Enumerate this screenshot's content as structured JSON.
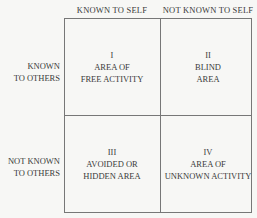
{
  "columns": [
    "KNOWN TO SELF",
    "NOT KNOWN TO SELF"
  ],
  "rows": [
    {
      "line1": "KNOWN",
      "line2": "TO OTHERS"
    },
    {
      "line1": "NOT KNOWN",
      "line2": "TO OTHERS"
    }
  ],
  "cells": [
    {
      "numeral": "I",
      "line1": "AREA OF",
      "line2": "FREE ACTIVITY"
    },
    {
      "numeral": "II",
      "line1": "BLIND",
      "line2": "AREA"
    },
    {
      "numeral": "III",
      "line1": "AVOIDED OR",
      "line2": "HIDDEN AREA"
    },
    {
      "numeral": "IV",
      "line1": "AREA OF",
      "line2": "UNKNOWN ACTIVITY"
    }
  ]
}
